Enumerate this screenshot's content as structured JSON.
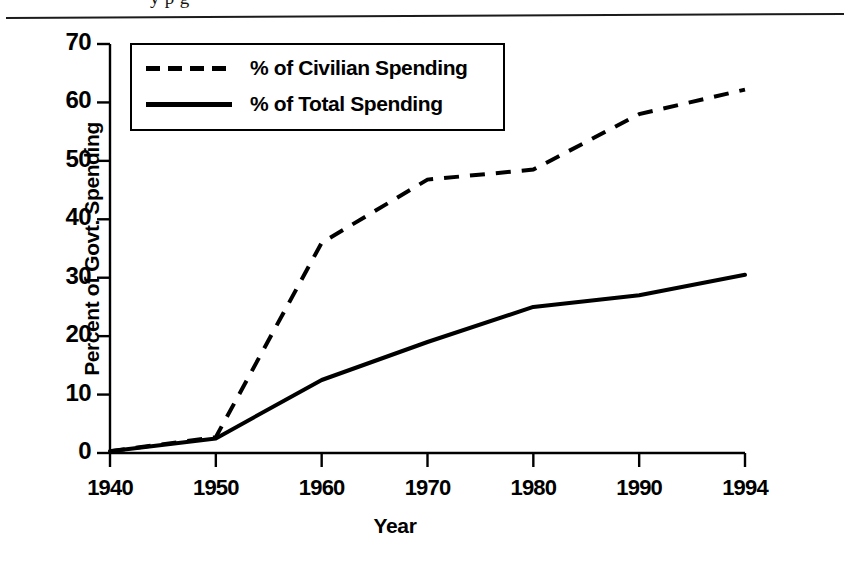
{
  "page": {
    "running_head": "y p g",
    "rule": "horizontal-rule"
  },
  "chart_data": {
    "type": "line",
    "title": "",
    "xlabel": "Year",
    "ylabel": "Percent of Govt. Spending",
    "x": [
      1940,
      1950,
      1960,
      1970,
      1980,
      1990,
      1994
    ],
    "xtick_labels": [
      "1940",
      "1950",
      "1960",
      "1970",
      "1980",
      "1990",
      "1994"
    ],
    "ytick_labels": [
      "0",
      "10",
      "20",
      "30",
      "40",
      "50",
      "60",
      "70"
    ],
    "yticks": [
      0,
      10,
      20,
      30,
      40,
      50,
      60,
      70
    ],
    "ylim": [
      0,
      70
    ],
    "grid": false,
    "legend_position": "upper-left-inside",
    "series": [
      {
        "name": "% of Civilian Spending",
        "style": "dashed",
        "color": "#000000",
        "values": [
          0.3,
          2.7,
          36.0,
          46.8,
          48.5,
          58.0,
          62.2
        ]
      },
      {
        "name": "% of Total Spending",
        "style": "solid",
        "color": "#000000",
        "values": [
          0.3,
          2.5,
          12.5,
          19.0,
          25.0,
          27.0,
          30.5
        ]
      }
    ]
  }
}
